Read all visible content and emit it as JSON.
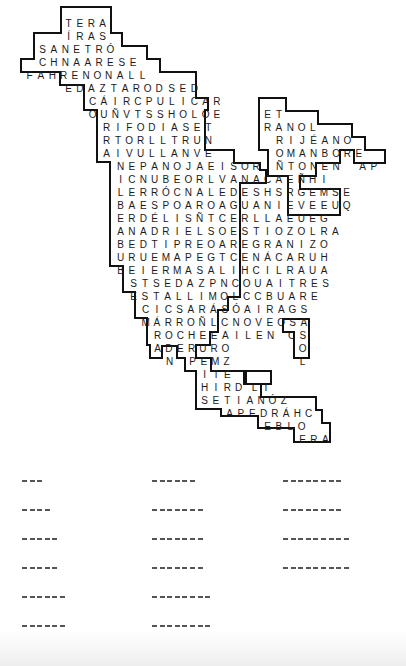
{
  "puzzle": {
    "type": "word-search",
    "shape": "North America map",
    "cell_w": 11.3,
    "row_h": 13.1,
    "rows": [
      {
        "x": 63,
        "y": 13,
        "text": "TERA"
      },
      {
        "x": 63,
        "y": 26,
        "text": "ÍRAS"
      },
      {
        "x": 37,
        "y": 39,
        "text": "SANETRÓ"
      },
      {
        "x": 37,
        "y": 52,
        "text": "CHNAARESE"
      },
      {
        "x": 24,
        "y": 65,
        "text": "FAHRENONALL"
      },
      {
        "x": 63,
        "y": 78,
        "text": "EDAZTAROD"
      },
      {
        "x": 166,
        "y": 78,
        "text": "SED"
      },
      {
        "x": 87,
        "y": 91,
        "text": "CÁIRCPULICAR"
      },
      {
        "x": 87,
        "y": 104,
        "text": "OUÑVTSSHOLOE"
      },
      {
        "x": 262,
        "y": 104,
        "text": "ET"
      },
      {
        "x": 101,
        "y": 117,
        "text": "RIFODIASET"
      },
      {
        "x": 262,
        "y": 117,
        "text": "RANOL"
      },
      {
        "x": 101,
        "y": 130,
        "text": "RTORLLTRUN"
      },
      {
        "x": 274,
        "y": 130,
        "text": "RIJÉANO"
      },
      {
        "x": 101,
        "y": 143,
        "text": "AIVULLANVE"
      },
      {
        "x": 274,
        "y": 143,
        "text": "OMANBORE"
      },
      {
        "x": 115,
        "y": 156,
        "text": "NEPANOJAEISOR"
      },
      {
        "x": 274,
        "y": 156,
        "text": "ÑTONEN"
      },
      {
        "x": 357,
        "y": 156,
        "text": "AP"
      },
      {
        "x": 115,
        "y": 169,
        "text": "ICNUBEORLVANACAEÑHI"
      },
      {
        "x": 115,
        "y": 182,
        "text": "LERRÓCNALEDESHSRGEMSE"
      },
      {
        "x": 115,
        "y": 195,
        "text": "BAESPOAROAGUANIEVEEUQ"
      },
      {
        "x": 115,
        "y": 208,
        "text": "ERDÉLISÑTCERLLAEUEG"
      },
      {
        "x": 115,
        "y": 221,
        "text": "ANADRIELSOESTIOZOLRA"
      },
      {
        "x": 115,
        "y": 234,
        "text": "BEDTIPREOAREGRANIZO"
      },
      {
        "x": 115,
        "y": 247,
        "text": "URUEMAPEGTCENÁCARUH"
      },
      {
        "x": 115,
        "y": 260,
        "text": "BEIERMASALIHCILRAUA"
      },
      {
        "x": 128,
        "y": 273,
        "text": "STSEDAZPNCOUAITRES"
      },
      {
        "x": 128,
        "y": 286,
        "text": "ESTALLIMOLCCBUARE"
      },
      {
        "x": 140,
        "y": 299,
        "text": "CICSARÁSÓAIRAGS"
      },
      {
        "x": 140,
        "y": 312,
        "text": "MÁRROÑLCNOVEOSA"
      },
      {
        "x": 152,
        "y": 325,
        "text": "ROCHEEAILEN"
      },
      {
        "x": 286,
        "y": 325,
        "text": "CS"
      },
      {
        "x": 152,
        "y": 338,
        "text": "ADERURO"
      },
      {
        "x": 297,
        "y": 338,
        "text": "O"
      },
      {
        "x": 164,
        "y": 351,
        "text": "N"
      },
      {
        "x": 187,
        "y": 351,
        "text": "PEMZ"
      },
      {
        "x": 297,
        "y": 351,
        "text": "L"
      },
      {
        "x": 199,
        "y": 364,
        "text": "ITE"
      },
      {
        "x": 199,
        "y": 377,
        "text": "HIRD"
      },
      {
        "x": 249,
        "y": 377,
        "text": "LI"
      },
      {
        "x": 199,
        "y": 390,
        "text": "SETIANÓZ"
      },
      {
        "x": 224,
        "y": 403,
        "text": "APEDRÁHC"
      },
      {
        "x": 262,
        "y": 416,
        "text": "EBLO"
      },
      {
        "x": 297,
        "y": 429,
        "text": "ERA"
      }
    ]
  },
  "answers": {
    "columns": [
      {
        "x": 22,
        "blanks": [
          3,
          4,
          5,
          5,
          6,
          6
        ]
      },
      {
        "x": 152,
        "blanks": [
          6,
          7,
          7,
          7,
          8,
          8
        ]
      },
      {
        "x": 283,
        "blanks": [
          8,
          8,
          9,
          9
        ]
      }
    ],
    "row_y": [
      17,
      46,
      75,
      104,
      133,
      162
    ]
  }
}
